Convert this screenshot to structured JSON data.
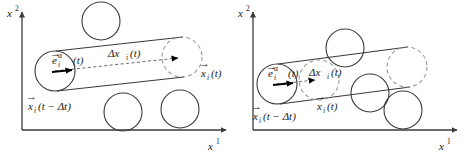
{
  "figure": {
    "panel_count": 2,
    "stroke_color": "#3a3a3a",
    "dashed_color": "#9a9a9a",
    "arrow_color": "#000000",
    "background": "#ffffff"
  },
  "panels": [
    {
      "id": "left",
      "name": "long-displacement-panel",
      "axes": {
        "y_label_base": "x",
        "y_label_sup": "2",
        "x_label_base": "x",
        "x_label_sup": "1",
        "origin": [
          22,
          130
        ],
        "x_end": [
          228,
          130
        ],
        "y_top": [
          22,
          10
        ]
      },
      "labels": {
        "direction_vector": "e",
        "direction_vector_sub": "i",
        "direction_vector_sup": "α",
        "direction_vector_arg": "(t)",
        "displacement": "Δx",
        "displacement_sub": "i",
        "displacement_arg": "(t)",
        "position_start": "x",
        "position_start_sub": "i",
        "position_start_arg": "(t − Δt)",
        "position_end": "x",
        "position_end_sub": "i",
        "position_end_arg": "(t)"
      },
      "particle_start": {
        "cx": 55,
        "cy": 71,
        "r": 20,
        "style": "solid"
      },
      "particle_end": {
        "cx": 182,
        "cy": 57,
        "r": 20,
        "style": "dashed"
      },
      "obstacles": [
        {
          "cx": 101,
          "cy": 21,
          "r": 19,
          "style": "solid"
        },
        {
          "cx": 123,
          "cy": 112,
          "r": 19,
          "style": "solid"
        },
        {
          "cx": 180,
          "cy": 109,
          "r": 19,
          "style": "solid"
        }
      ]
    },
    {
      "id": "right",
      "name": "short-displacement-panel",
      "axes": {
        "y_label_base": "x",
        "y_label_sup": "2",
        "x_label_base": "x",
        "x_label_sup": "1",
        "origin": [
          18,
          130
        ],
        "x_end": [
          226,
          130
        ],
        "y_top": [
          18,
          10
        ]
      },
      "labels": {
        "direction_vector": "e",
        "direction_vector_sub": "i",
        "direction_vector_sup": "α",
        "direction_vector_arg": "(t)",
        "displacement": "Δx",
        "displacement_sub": "i",
        "displacement_arg": "(t)",
        "position_start": "x",
        "position_start_sub": "i",
        "position_start_arg": "(t − Δt)",
        "position_end": "x",
        "position_end_sub": "i",
        "position_end_arg": "(t)"
      },
      "particle_start": {
        "cx": 42,
        "cy": 84,
        "r": 20,
        "style": "solid"
      },
      "particle_end": {
        "cx": 84,
        "cy": 80,
        "r": 20,
        "style": "dashed"
      },
      "ghost_circle": {
        "cx": 172,
        "cy": 67,
        "r": 20,
        "style": "dashed"
      },
      "obstacles": [
        {
          "cx": 110,
          "cy": 48,
          "r": 19,
          "style": "solid"
        },
        {
          "cx": 135,
          "cy": 93,
          "r": 19,
          "style": "solid"
        },
        {
          "cx": 168,
          "cy": 110,
          "r": 19,
          "style": "solid"
        }
      ]
    }
  ]
}
